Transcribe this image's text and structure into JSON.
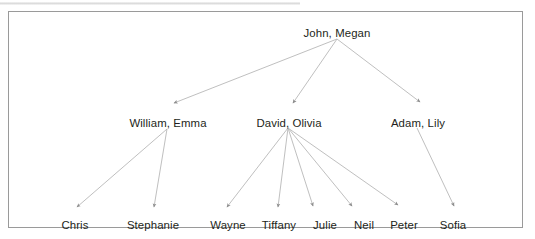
{
  "diagram": {
    "type": "family-tree",
    "title": "",
    "frame": {
      "border_color": "#9a9a9a",
      "background": "#ffffff"
    },
    "edge_color": "#b4b4b4",
    "text_color": "#231f20",
    "generations": [
      {
        "level": 1,
        "nodes": [
          {
            "id": "john-megan",
            "label": "John, Megan",
            "x": 337,
            "y": 27
          }
        ]
      },
      {
        "level": 2,
        "nodes": [
          {
            "id": "william-emma",
            "label": "William, Emma",
            "x": 168,
            "y": 117
          },
          {
            "id": "david-olivia",
            "label": "David, Olivia",
            "x": 289,
            "y": 117
          },
          {
            "id": "adam-lily",
            "label": "Adam, Lily",
            "x": 418,
            "y": 117
          }
        ]
      },
      {
        "level": 3,
        "nodes": [
          {
            "id": "chris",
            "label": "Chris",
            "x": 75,
            "y": 219
          },
          {
            "id": "stephanie",
            "label": "Stephanie",
            "x": 153,
            "y": 219
          },
          {
            "id": "wayne",
            "label": "Wayne",
            "x": 228,
            "y": 219
          },
          {
            "id": "tiffany",
            "label": "Tiffany",
            "x": 279,
            "y": 219
          },
          {
            "id": "julie",
            "label": "Julie",
            "x": 325,
            "y": 219
          },
          {
            "id": "neil",
            "label": "Neil",
            "x": 364,
            "y": 219
          },
          {
            "id": "peter",
            "label": "Peter",
            "x": 404,
            "y": 219
          },
          {
            "id": "sofia",
            "label": "Sofia",
            "x": 453,
            "y": 219
          }
        ]
      }
    ],
    "edges": [
      {
        "from": "john-megan",
        "to": "william-emma",
        "x1": 337,
        "y1": 39,
        "x2": 174,
        "y2": 103
      },
      {
        "from": "john-megan",
        "to": "david-olivia",
        "x1": 337,
        "y1": 39,
        "x2": 293,
        "y2": 103
      },
      {
        "from": "john-megan",
        "to": "adam-lily",
        "x1": 337,
        "y1": 39,
        "x2": 420,
        "y2": 102
      },
      {
        "from": "william-emma",
        "to": "chris",
        "x1": 167,
        "y1": 129,
        "x2": 77,
        "y2": 207
      },
      {
        "from": "william-emma",
        "to": "stephanie",
        "x1": 167,
        "y1": 129,
        "x2": 154,
        "y2": 207
      },
      {
        "from": "david-olivia",
        "to": "wayne",
        "x1": 288,
        "y1": 128,
        "x2": 227,
        "y2": 207
      },
      {
        "from": "david-olivia",
        "to": "tiffany",
        "x1": 288,
        "y1": 128,
        "x2": 278,
        "y2": 207
      },
      {
        "from": "david-olivia",
        "to": "julie",
        "x1": 288,
        "y1": 128,
        "x2": 313,
        "y2": 206
      },
      {
        "from": "david-olivia",
        "to": "neil",
        "x1": 288,
        "y1": 128,
        "x2": 352,
        "y2": 206
      },
      {
        "from": "david-olivia",
        "to": "peter",
        "x1": 288,
        "y1": 128,
        "x2": 398,
        "y2": 205
      },
      {
        "from": "adam-lily",
        "to": "sofia",
        "x1": 417,
        "y1": 128,
        "x2": 454,
        "y2": 206
      }
    ]
  }
}
